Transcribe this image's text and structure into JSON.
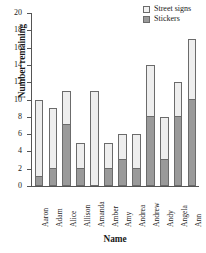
{
  "chart_data": {
    "type": "bar",
    "subtype": "stacked-vertical",
    "title": "",
    "xlabel": "Name",
    "ylabel": "Number remaining",
    "ylim": [
      0,
      20
    ],
    "ytick_step": 2,
    "yticks": [
      0,
      2,
      4,
      6,
      8,
      10,
      12,
      14,
      16,
      18,
      20
    ],
    "ytick_labels": [
      "0",
      "2",
      "4",
      "6",
      "8",
      "10",
      "12",
      "14",
      "16",
      "18",
      "20"
    ],
    "grid": false,
    "legend_position": "top-right",
    "categories": [
      "Aaron",
      "Adam",
      "Alice",
      "Allison",
      "Amanda",
      "Amber",
      "Amy",
      "Andrea",
      "Andrew",
      "Andy",
      "Angela",
      "Ann"
    ],
    "series": [
      {
        "name": "Stickers",
        "color": "#9a9a9a",
        "values": [
          1,
          2,
          7,
          2,
          0,
          2,
          3,
          2,
          8,
          3,
          8,
          10
        ]
      },
      {
        "name": "Street signs",
        "color": "#eeeeee",
        "values": [
          9,
          7,
          4,
          3,
          11,
          3,
          3,
          4,
          6,
          5,
          4,
          7
        ]
      }
    ],
    "totals": [
      10,
      9,
      11,
      5,
      11,
      5,
      6,
      6,
      14,
      8,
      12,
      17
    ]
  },
  "legend": {
    "items": [
      {
        "label": "Street signs",
        "swatch": "street-signs-swatch"
      },
      {
        "label": "Stickers",
        "swatch": "stickers-swatch"
      }
    ]
  },
  "axes": {
    "y_title": "Number remaining",
    "x_title": "Name"
  }
}
